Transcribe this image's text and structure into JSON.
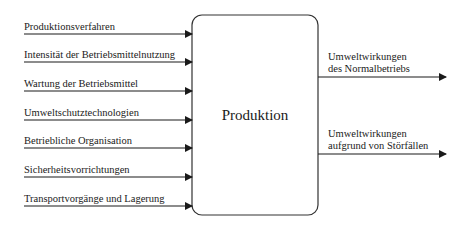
{
  "process": {
    "label": "Produktion"
  },
  "inputs": [
    {
      "label": "Produktionsverfahren"
    },
    {
      "label": "Intensität der Betriebsmittelnutzung"
    },
    {
      "label": "Wartung der Betriebsmittel"
    },
    {
      "label": "Umweltschutztechnologien"
    },
    {
      "label": "Betriebliche Organisation"
    },
    {
      "label": "Sicherheitsvorrichtungen"
    },
    {
      "label": "Transportvorgänge und Lagerung"
    }
  ],
  "outputs": [
    {
      "line1": "Umweltwirkungen",
      "line2": "des Normalbetriebs"
    },
    {
      "line1": "Umweltwirkungen",
      "line2": "aufgrund von Störfällen"
    }
  ],
  "colors": {
    "stroke": "#1a1a1a",
    "box": "#333333"
  }
}
